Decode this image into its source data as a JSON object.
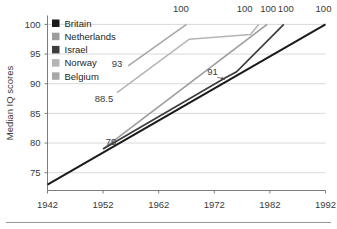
{
  "chart_data": {
    "type": "line",
    "title": "",
    "xlabel": "",
    "ylabel": "Median IQ scores",
    "xlim": [
      1942,
      1992
    ],
    "ylim": [
      72,
      101.5
    ],
    "xticks": [
      "1942",
      "1952",
      "1962",
      "1972",
      "1982",
      "1992"
    ],
    "yticks": [
      "75",
      "80",
      "85",
      "90",
      "95",
      "100"
    ],
    "grid": true,
    "legend_position": "top-left",
    "series": [
      {
        "name": "Britain",
        "color": "#1a1a1a",
        "width": 2.0,
        "points": [
          [
            1942,
            73.0
          ],
          [
            1992,
            100.0
          ]
        ],
        "labels": [
          {
            "text": "100",
            "x": 1992,
            "y": 100.0,
            "dx": -2,
            "dy": -12,
            "anchor": "middle"
          }
        ]
      },
      {
        "name": "Netherlands",
        "color": "#9d9d9d",
        "width": 1.6,
        "points": [
          [
            1952,
            79.0
          ],
          [
            1981.5,
            100.0
          ]
        ],
        "labels": [
          {
            "text": "79",
            "x": 1952,
            "y": 79.0,
            "dx": 8,
            "dy": -4,
            "anchor": "middle"
          },
          {
            "text": "100",
            "x": 1981.5,
            "y": 100.0,
            "dx": 1,
            "dy": -12,
            "anchor": "middle"
          }
        ]
      },
      {
        "name": "Israel",
        "color": "#3d3d3d",
        "width": 1.7,
        "points": [
          [
            1952,
            79.0
          ],
          [
            1974.0,
            91.0
          ],
          [
            1976.0,
            92.0
          ],
          [
            1984.5,
            100.0
          ]
        ],
        "labels": [
          {
            "text": "91",
            "x": 1974.0,
            "y": 91.0,
            "dx": -13,
            "dy": -3,
            "anchor": "middle"
          },
          {
            "text": "100",
            "x": 1984.5,
            "y": 100.0,
            "dx": 2,
            "dy": -12,
            "anchor": "middle"
          }
        ]
      },
      {
        "name": "Norway",
        "color": "#b5b5b5",
        "width": 1.6,
        "points": [
          [
            1954.5,
            88.5
          ],
          [
            1967.5,
            97.5
          ],
          [
            1978.5,
            98.3
          ],
          [
            1980.0,
            100.0
          ]
        ],
        "labels": [
          {
            "text": "88.5",
            "x": 1954.5,
            "y": 88.5,
            "dx": -13,
            "dy": 9,
            "anchor": "middle"
          },
          {
            "text": "100",
            "x": 1978.0,
            "y": 100.0,
            "dx": -3,
            "dy": -12,
            "anchor": "middle"
          }
        ]
      },
      {
        "name": "Belgium",
        "color": "#a8a8a8",
        "width": 1.6,
        "points": [
          [
            1956.5,
            93.0
          ],
          [
            1967.0,
            100.0
          ]
        ],
        "labels": [
          {
            "text": "93",
            "x": 1956.5,
            "y": 93.0,
            "dx": -11,
            "dy": 1,
            "anchor": "middle"
          },
          {
            "text": "100",
            "x": 1966.0,
            "y": 100.0,
            "dx": 0,
            "dy": -12,
            "anchor": "middle"
          }
        ]
      }
    ]
  },
  "legend": {
    "items": [
      {
        "label": "Britain",
        "color": "#1a1a1a"
      },
      {
        "label": "Netherlands",
        "color": "#9d9d9d"
      },
      {
        "label": "Israel",
        "color": "#3d3d3d"
      },
      {
        "label": "Norway",
        "color": "#b5b5b5"
      },
      {
        "label": "Belgium",
        "color": "#a8a8a8"
      }
    ]
  },
  "axes": {
    "y_title": "Median IQ scores"
  }
}
